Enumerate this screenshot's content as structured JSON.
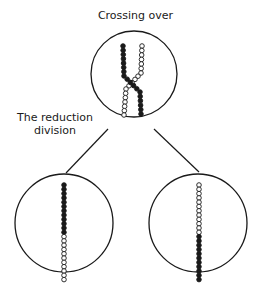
{
  "labels": {
    "top": "Crossing over",
    "side_line1": "The reduction",
    "side_line2": "division"
  },
  "colors": {
    "ink": "#1a1a1a",
    "background": "#ffffff"
  },
  "figure": {
    "top_cell": {
      "description": "Crossing over of paired chromatids (filled and open beads)"
    },
    "left_daughter": {
      "upper": "filled",
      "lower": "open"
    },
    "right_daughter": {
      "upper": "open",
      "lower": "filled"
    }
  }
}
